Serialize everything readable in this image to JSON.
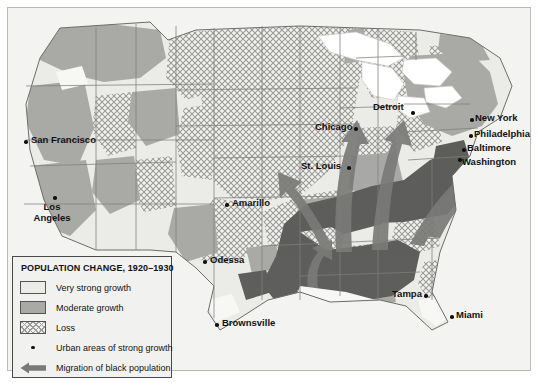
{
  "map": {
    "title": "Population Change 1920-1930 map of the United States",
    "legend": {
      "title": "POPULATION CHANGE, 1920–1930",
      "items": [
        {
          "key": "very-strong-growth",
          "label": "Very strong growth",
          "symbol": "swatch",
          "color": "#ebebe8"
        },
        {
          "key": "moderate-growth",
          "label": "Moderate growth",
          "symbol": "swatch",
          "color": "#a9a9a6"
        },
        {
          "key": "loss",
          "label": "Loss",
          "symbol": "swatch-hatch",
          "color": "#9b9b98"
        },
        {
          "key": "urban-areas",
          "label": "Urban areas of strong growth",
          "symbol": "dot",
          "color": "#111111"
        },
        {
          "key": "migration",
          "label": "Migration of black population",
          "symbol": "arrow",
          "color": "#7a7a78"
        }
      ]
    },
    "cities": [
      {
        "name": "San Francisco",
        "label_x": 31,
        "label_y": 137,
        "dot_x": 24,
        "dot_y": 140,
        "lines": 1
      },
      {
        "name": "Los Angeles",
        "label_x": 8,
        "label_y": 200,
        "dot_x": 53,
        "dot_y": 196,
        "lines": 2,
        "line1": "Los",
        "line2": "Angeles"
      },
      {
        "name": "Amarillo",
        "label_x": 232,
        "label_y": 200,
        "dot_x": 225,
        "dot_y": 203,
        "lines": 1
      },
      {
        "name": "Odessa",
        "label_x": 210,
        "label_y": 257,
        "dot_x": 203,
        "dot_y": 260,
        "lines": 1
      },
      {
        "name": "Brownsville",
        "label_x": 222,
        "label_y": 320,
        "dot_x": 215,
        "dot_y": 323,
        "lines": 1
      },
      {
        "name": "St. Louis",
        "label_x": 301,
        "label_y": 161,
        "dot_x": 347,
        "dot_y": 166,
        "lines": 1
      },
      {
        "name": "Chicago",
        "label_x": 318,
        "label_y": 123,
        "dot_x": 354,
        "dot_y": 127,
        "lines": 1
      },
      {
        "name": "Detroit",
        "label_x": 374,
        "label_y": 103,
        "dot_x": 411,
        "dot_y": 111,
        "lines": 1
      },
      {
        "name": "New York",
        "label_x": 476,
        "label_y": 116,
        "dot_x": 470,
        "dot_y": 118,
        "lines": 1
      },
      {
        "name": "Philadelphia",
        "label_x": 475,
        "label_y": 131,
        "dot_x": 469,
        "dot_y": 134,
        "lines": 1
      },
      {
        "name": "Baltimore",
        "label_x": 469,
        "label_y": 146,
        "dot_x": 462,
        "dot_y": 148,
        "lines": 1
      },
      {
        "name": "Washington",
        "label_x": 464,
        "label_y": 160,
        "dot_x": 458,
        "dot_y": 157,
        "lines": 1
      },
      {
        "name": "Tampa",
        "label_x": 392,
        "label_y": 292,
        "dot_x": 424,
        "dot_y": 294,
        "lines": 1
      },
      {
        "name": "Miami",
        "label_x": 457,
        "label_y": 312,
        "dot_x": 450,
        "dot_y": 315,
        "lines": 1
      }
    ],
    "colors": {
      "background": "#f3f3f1",
      "very_strong_growth": "#ebebe8",
      "moderate_growth": "#a9a9a6",
      "loss_hatch": "#9b9b98",
      "migration_source": "#5e5e5c",
      "arrow": "#7a7a78",
      "water": "#ffffff",
      "border": "#7d7d7a",
      "frame": "#b9b9b5"
    }
  }
}
